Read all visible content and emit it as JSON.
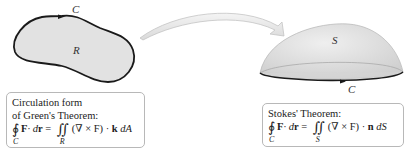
{
  "region": {
    "region_label": "R",
    "curve_label": "C"
  },
  "surface": {
    "surface_label": "S",
    "curve_label": "C"
  },
  "arrow": {
    "direction": "region-to-surface"
  },
  "greens_box": {
    "title_line1": "Circulation form",
    "title_line2": "of Green's Theorem:",
    "lhs_contour": "∮",
    "lhs_sub": "C",
    "lhs_expr_F": "F",
    "lhs_expr_rest": " · d",
    "lhs_expr_r": "r",
    "equals": " = ",
    "rhs_integral": "∬",
    "rhs_sub": "R",
    "rhs_expr": "(∇ × F) · ",
    "rhs_vec": "k",
    "rhs_diff": " dA"
  },
  "stokes_box": {
    "title": "Stokes' Theorem:",
    "lhs_contour": "∮",
    "lhs_sub": "C",
    "lhs_expr_F": "F",
    "lhs_expr_rest": " · d",
    "lhs_expr_r": "r",
    "equals": " = ",
    "rhs_integral": "∬",
    "rhs_sub": "S",
    "rhs_expr": "(∇ × F) · ",
    "rhs_vec": "n",
    "rhs_diff": " dS"
  },
  "colors": {
    "region_fill": "#e2e2e2",
    "outline": "#1a1a1a",
    "surface_fill": "#dcdcdc",
    "arrow_fill": "#ececec",
    "box_border": "#b8b8b8"
  }
}
